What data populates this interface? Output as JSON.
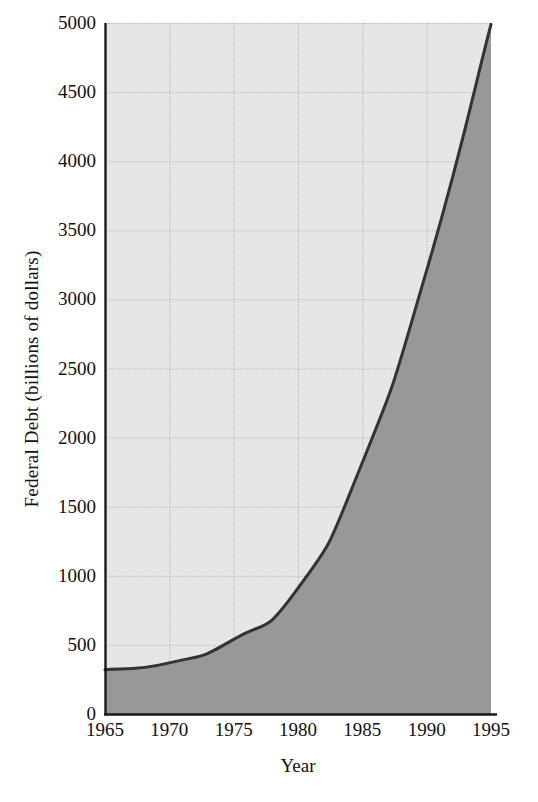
{
  "chart_data": {
    "type": "area",
    "title": "",
    "subtitle": "",
    "xlabel": "Year",
    "ylabel": "Federal Debt (billions of dollars)",
    "xlim": [
      1965,
      1995
    ],
    "ylim": [
      0,
      5000
    ],
    "xticks": [
      1965,
      1970,
      1975,
      1980,
      1985,
      1990,
      1995
    ],
    "xtick_labels": [
      "1965",
      "1970",
      "1975",
      "1980",
      "1985",
      "1990",
      "1995"
    ],
    "yticks": [
      0,
      500,
      1000,
      1500,
      2000,
      2500,
      3000,
      3500,
      4000,
      4500,
      5000
    ],
    "ytick_labels": [
      "0",
      "500",
      "1000",
      "1500",
      "2000",
      "2500",
      "3000",
      "3500",
      "4000",
      "4500",
      "5000"
    ],
    "grid": true,
    "legend": "none",
    "x": [
      1965,
      1970,
      1975,
      1980,
      1985,
      1990,
      1995
    ],
    "values": [
      320,
      370,
      540,
      910,
      1820,
      3210,
      4990
    ],
    "series": [
      {
        "name": "Federal Debt",
        "values": [
          320,
          370,
          540,
          910,
          1820,
          3210,
          4990
        ]
      }
    ],
    "colors": {
      "area_fill": "#989898",
      "plot_background": "#e6e6e6",
      "line": "#333333",
      "grid": "#b4b4b4",
      "axis": "#1a1a1a",
      "page_background": "#ffffff"
    }
  }
}
